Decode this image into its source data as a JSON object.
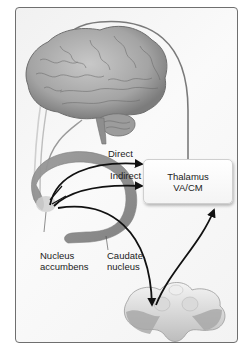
{
  "figure": {
    "type": "basal ganglia pathway diagram",
    "colors": {
      "frame_border": "#6f6f6f",
      "background": "#f5f5f5",
      "brain": "#a8a8a8",
      "caudate": "#8e8e8e",
      "arrow": "#111111",
      "projection_line": "#7a7a7a"
    }
  },
  "labels": {
    "direct": "Direct",
    "indirect": "Indirect",
    "thalamus_line1": "Thalamus",
    "thalamus_line2": "VA/CM",
    "nucleus_line1": "Nucleus",
    "nucleus_line2": "accumbens",
    "caudate_line1": "Caudate",
    "caudate_line2": "nucleus"
  },
  "structures": [
    {
      "name": "Cerebral cortex (brain)"
    },
    {
      "name": "Caudate nucleus"
    },
    {
      "name": "Nucleus accumbens"
    },
    {
      "name": "Thalamus VA/CM"
    },
    {
      "name": "Midbrain / brainstem section"
    }
  ],
  "pathways": [
    {
      "from": "Nucleus accumbens",
      "to": "Thalamus VA/CM",
      "label": "Direct"
    },
    {
      "from": "Nucleus accumbens",
      "to": "Thalamus VA/CM",
      "label": "Indirect"
    },
    {
      "from": "Nucleus accumbens",
      "to": "Midbrain"
    },
    {
      "from": "Midbrain",
      "to": "Thalamus VA/CM"
    },
    {
      "from": "Thalamus VA/CM",
      "to": "Cerebral cortex"
    },
    {
      "from": "Cerebral cortex",
      "to": "Caudate nucleus"
    }
  ]
}
